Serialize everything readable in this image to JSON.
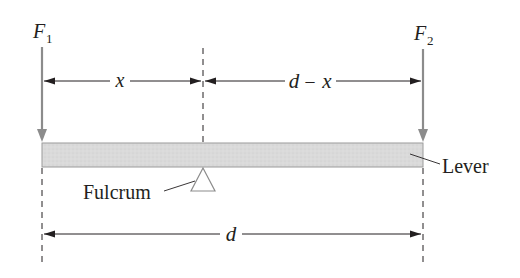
{
  "diagram": {
    "forces": [
      {
        "symbol": "F",
        "subscript": "1"
      },
      {
        "symbol": "F",
        "subscript": "2"
      }
    ],
    "dimensions": {
      "left": "x",
      "right_d": "d",
      "right_minus": "–",
      "right_x": "x",
      "total": "d"
    },
    "labels": {
      "fulcrum": "Fulcrum",
      "lever": "Lever"
    },
    "fulcrum_position_fraction": 0.42,
    "colors": {
      "lever_fill": "#d9d9d9",
      "lever_stroke": "#9a9a9a",
      "force_arrow": "#8c8c8c",
      "line": "#231f20"
    }
  }
}
